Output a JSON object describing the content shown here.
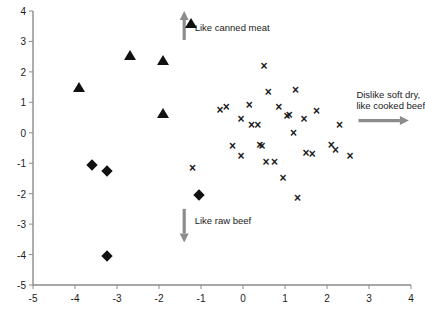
{
  "chart_data": {
    "type": "scatter",
    "title": "",
    "xlabel": "",
    "ylabel": "",
    "xlim": [
      -5,
      4
    ],
    "ylim": [
      -5,
      4
    ],
    "grid": false,
    "legend": "none",
    "xticks": [
      -5,
      -4,
      -3,
      -2,
      -1,
      0,
      1,
      2,
      3,
      4
    ],
    "yticks": [
      -5,
      -4,
      -3,
      -2,
      -1,
      0,
      1,
      2,
      3,
      4
    ],
    "xtick_labels": [
      "-5",
      "-4",
      "-3",
      "-2",
      "-1",
      "0",
      "1",
      "2",
      "3",
      "4"
    ],
    "ytick_labels": [
      "-5",
      "-4",
      "-3",
      "-2",
      "-1",
      "0",
      "1",
      "2",
      "3",
      "4"
    ],
    "series": [
      {
        "name": "group-triangle",
        "marker": "triangle",
        "color": "#111111",
        "points": [
          [
            -3.9,
            1.5
          ],
          [
            -2.7,
            2.55
          ],
          [
            -1.9,
            2.4
          ],
          [
            -1.9,
            0.65
          ],
          [
            -1.25,
            3.6
          ]
        ]
      },
      {
        "name": "group-diamond",
        "marker": "diamond",
        "color": "#111111",
        "points": [
          [
            -3.6,
            -1.05
          ],
          [
            -3.25,
            -1.25
          ],
          [
            -3.25,
            -4.05
          ],
          [
            -1.05,
            -2.05
          ]
        ]
      },
      {
        "name": "group-cross",
        "marker": "x",
        "color": "#1a1a1a",
        "points": [
          [
            -1.2,
            -1.15
          ],
          [
            -0.55,
            0.75
          ],
          [
            -0.4,
            0.85
          ],
          [
            -0.25,
            -0.45
          ],
          [
            -0.05,
            0.45
          ],
          [
            -0.05,
            -0.75
          ],
          [
            0.15,
            0.9
          ],
          [
            0.2,
            0.25
          ],
          [
            0.35,
            0.25
          ],
          [
            0.4,
            -0.4
          ],
          [
            0.45,
            -0.45
          ],
          [
            0.5,
            2.2
          ],
          [
            0.55,
            -0.95
          ],
          [
            0.6,
            1.35
          ],
          [
            0.75,
            -0.95
          ],
          [
            0.85,
            0.85
          ],
          [
            0.95,
            -1.5
          ],
          [
            1.05,
            0.55
          ],
          [
            1.1,
            0.6
          ],
          [
            1.2,
            0.0
          ],
          [
            1.25,
            1.4
          ],
          [
            1.3,
            -2.15
          ],
          [
            1.45,
            0.45
          ],
          [
            1.5,
            -0.65
          ],
          [
            1.65,
            -0.7
          ],
          [
            1.75,
            0.7
          ],
          [
            2.1,
            -0.4
          ],
          [
            2.2,
            -0.55
          ],
          [
            2.3,
            0.25
          ],
          [
            2.55,
            -0.75
          ]
        ]
      }
    ],
    "annotations": [
      {
        "name": "like-canned-meat",
        "text": "Like canned meat",
        "direction": "up",
        "arrow_x": -1.4,
        "arrow_from_y": 3.05,
        "arrow_to_y": 4.0,
        "label_x": -1.15,
        "label_y": 3.45
      },
      {
        "name": "dislike-soft-dry-like-cooked-beef",
        "text": "Dislike soft dry,\nlike cooked beef",
        "line1": "Dislike soft dry,",
        "line2": "like cooked beef",
        "direction": "right",
        "arrow_y": 0.4,
        "arrow_from_x": 2.75,
        "arrow_to_x": 3.95,
        "label_x": 2.7,
        "label_y": 1.25
      },
      {
        "name": "like-raw-beef",
        "text": "Like raw beef",
        "direction": "down",
        "arrow_x": -1.4,
        "arrow_from_y": -2.5,
        "arrow_to_y": -3.6,
        "label_x": -1.15,
        "label_y": -2.9
      }
    ],
    "axis_color": "#8a8a8a",
    "arrow_color": "#8c8c8c"
  }
}
